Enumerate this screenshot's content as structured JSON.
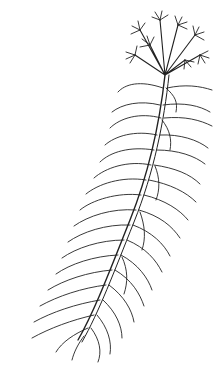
{
  "illustration": {
    "subject": "aquatic plant line drawing with whorled linear leaves and terminal flower cluster",
    "stroke_color": "#222222",
    "background": "#ffffff"
  },
  "caption": {
    "text": "",
    "note_visible": "partially cut-off credit line at bottom-left edge (illegible)"
  }
}
